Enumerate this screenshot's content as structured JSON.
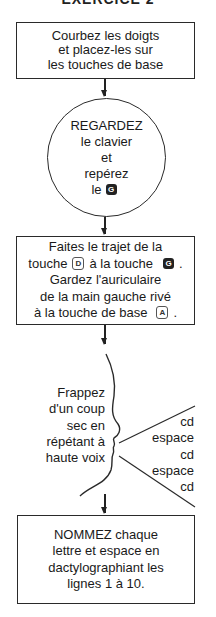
{
  "title": "EXERCICE 2",
  "steps": {
    "step1": {
      "lines": [
        "Courbez les doigts",
        "et placez-les sur",
        "les touches de base"
      ]
    },
    "step2": {
      "shape": "circle",
      "lines": [
        "REGARDEZ",
        "le clavier",
        "et",
        "repérez",
        "le"
      ],
      "key": "G"
    },
    "step3": {
      "line1": "Faites le trajet de la",
      "line2_prefix": "touche",
      "key_from": "D",
      "line2_middle": "à la touche",
      "key_to": "G",
      "line2_suffix": ".",
      "line3": "Gardez l'auriculaire",
      "line4": "de la main gauche rivé",
      "line5_prefix": "à la touche de base",
      "key_base": "A",
      "line5_suffix": "."
    },
    "step4": {
      "instruction_lines": [
        "Frappez",
        "d'un coup",
        "sec en",
        "répétant à",
        "haute voix"
      ],
      "spoken_sequence": [
        "cd",
        "espace",
        "cd",
        "espace",
        "cd"
      ]
    },
    "step5": {
      "lines": [
        "NOMMEZ chaque",
        "lettre et espace en",
        "dactylographiant les",
        "lignes 1 à 10."
      ]
    }
  },
  "colors": {
    "line": "#2a2a2a",
    "text": "#1a1a1a",
    "key_filled": "#222222",
    "background": "#ffffff"
  }
}
